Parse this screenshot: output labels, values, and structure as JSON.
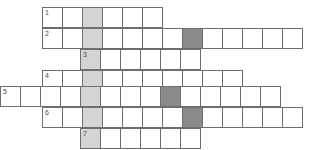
{
  "puzzle": {
    "title": "Crossword Grid",
    "cell_size": 21,
    "colors": {
      "background": "#ffffff",
      "cell_fill": "#ffffff",
      "cell_border": "#6e6e6e",
      "highlight_fill": "#d4d4d4",
      "block_fill": "#8a8a8a",
      "number_text": "#4a4a4a"
    },
    "highlight_column_x": 80,
    "rows": [
      {
        "number": "1",
        "x": 42,
        "y": 7,
        "length": 6,
        "highlight_index": 2,
        "block_indices": []
      },
      {
        "number": "2",
        "x": 42,
        "y": 28,
        "length": 13,
        "highlight_index": 2,
        "block_indices": [
          7
        ]
      },
      {
        "number": "3",
        "x": 80,
        "y": 49,
        "length": 6,
        "highlight_index": 0,
        "block_indices": []
      },
      {
        "number": "4",
        "x": 42,
        "y": 70,
        "length": 10,
        "highlight_index": 2,
        "block_indices": []
      },
      {
        "number": "5",
        "x": 0,
        "y": 86,
        "length": 14,
        "highlight_index": 4,
        "block_indices": [
          8
        ]
      },
      {
        "number": "6",
        "x": 42,
        "y": 107,
        "length": 13,
        "highlight_index": 2,
        "block_indices": [
          7
        ]
      },
      {
        "number": "7",
        "x": 80,
        "y": 128,
        "length": 6,
        "highlight_index": 0,
        "block_indices": []
      }
    ]
  }
}
